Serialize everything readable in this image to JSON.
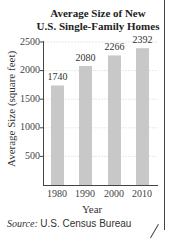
{
  "chart_data": {
    "type": "bar",
    "title_lines": [
      "Average Size of New",
      "U.S. Single-Family Homes"
    ],
    "categories": [
      "1980",
      "1990",
      "2000",
      "2010"
    ],
    "values": [
      1740,
      2080,
      2266,
      2392
    ],
    "value_labels": [
      "1740",
      "2080",
      "2266",
      "2392"
    ],
    "xlabel": "Year",
    "ylabel": "Average Size (square feet)",
    "ylim": [
      0,
      2500
    ],
    "yticks": [
      "2500",
      "2000",
      "1500",
      "1000",
      "500"
    ],
    "grid": true,
    "bar_color": "#c8c8c8",
    "legend": null
  },
  "source": {
    "label": "Source:",
    "value": "U.S. Census Bureau"
  }
}
